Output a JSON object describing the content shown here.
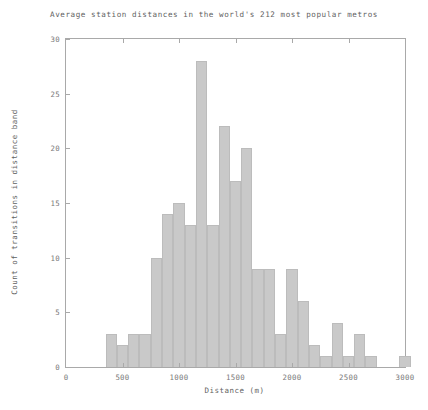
{
  "chart_data": {
    "type": "bar",
    "title": "Average station distances in the world's 212 most popular metros",
    "xlabel": "Distance (m)",
    "ylabel": "Count of transitions in distance band",
    "xlim": [
      0,
      3000
    ],
    "ylim": [
      0,
      30
    ],
    "bin_width": 100,
    "grid": false,
    "legend": null,
    "xticks": [
      0,
      500,
      1000,
      1500,
      2000,
      2500,
      3000
    ],
    "xtick_labels": [
      "0",
      "500",
      "1000",
      "1500",
      "2000",
      "2500",
      "3000"
    ],
    "yticks": [
      0,
      5,
      10,
      15,
      20,
      25,
      30
    ],
    "ytick_labels": [
      "0",
      "5",
      "10",
      "15",
      "20",
      "25",
      "30"
    ],
    "bar_color": "#c9c9c9",
    "bar_edge_color": "#bcbcbc",
    "axis_color": "#a9a9a9",
    "text_color": "#5f5f5f",
    "bins": [
      {
        "x0": 350,
        "x1": 450,
        "value": 3
      },
      {
        "x0": 450,
        "x1": 550,
        "value": 2
      },
      {
        "x0": 550,
        "x1": 650,
        "value": 3
      },
      {
        "x0": 650,
        "x1": 750,
        "value": 3
      },
      {
        "x0": 750,
        "x1": 850,
        "value": 10
      },
      {
        "x0": 850,
        "x1": 950,
        "value": 14
      },
      {
        "x0": 950,
        "x1": 1050,
        "value": 15
      },
      {
        "x0": 1050,
        "x1": 1150,
        "value": 13
      },
      {
        "x0": 1150,
        "x1": 1250,
        "value": 28
      },
      {
        "x0": 1250,
        "x1": 1350,
        "value": 13
      },
      {
        "x0": 1350,
        "x1": 1450,
        "value": 22
      },
      {
        "x0": 1450,
        "x1": 1550,
        "value": 17
      },
      {
        "x0": 1550,
        "x1": 1650,
        "value": 20
      },
      {
        "x0": 1650,
        "x1": 1750,
        "value": 9
      },
      {
        "x0": 1750,
        "x1": 1850,
        "value": 9
      },
      {
        "x0": 1850,
        "x1": 1950,
        "value": 3
      },
      {
        "x0": 1950,
        "x1": 2050,
        "value": 9
      },
      {
        "x0": 2050,
        "x1": 2150,
        "value": 6
      },
      {
        "x0": 2150,
        "x1": 2250,
        "value": 2
      },
      {
        "x0": 2250,
        "x1": 2350,
        "value": 1
      },
      {
        "x0": 2350,
        "x1": 2450,
        "value": 4
      },
      {
        "x0": 2450,
        "x1": 2550,
        "value": 1
      },
      {
        "x0": 2550,
        "x1": 2650,
        "value": 3
      },
      {
        "x0": 2650,
        "x1": 2750,
        "value": 1
      },
      {
        "x0": 2950,
        "x1": 3050,
        "value": 1
      }
    ]
  }
}
